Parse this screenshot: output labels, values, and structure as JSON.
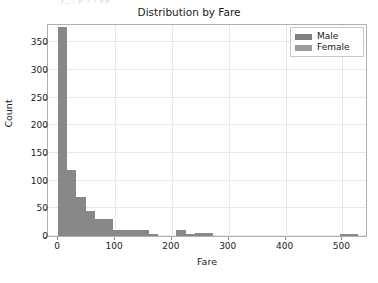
{
  "top_cutoff_text": "y_ , p ( )  pp",
  "axis": {
    "ylabel": "Count",
    "xlabel": "Fare",
    "yticks": [
      "0",
      "50",
      "100",
      "150",
      "200",
      "250",
      "300",
      "350"
    ],
    "xticks": [
      "0",
      "100",
      "200",
      "300",
      "400",
      "500"
    ]
  },
  "legend": {
    "items": [
      {
        "label": "Male",
        "color": "#7f7f7f"
      },
      {
        "label": "Female",
        "color": "#9a9a9a"
      }
    ]
  },
  "chart_data": {
    "type": "bar",
    "title": "Distribution by Fare",
    "xlabel": "Fare",
    "ylabel": "Count",
    "xlim": [
      -18,
      545
    ],
    "ylim": [
      0,
      385
    ],
    "grid": true,
    "legend_position": "upper right",
    "bin_width": 16,
    "bar_color": "#888888",
    "series": [
      {
        "name": "Male",
        "color": "#7f7f7f",
        "note": "overlapping histogram; bars render as merged gray"
      },
      {
        "name": "Female",
        "color": "#9a9a9a",
        "note": "overlapping histogram; bars render as merged gray"
      }
    ],
    "bins": [
      {
        "x0": 0,
        "x1": 16,
        "count": 377
      },
      {
        "x0": 16,
        "x1": 32,
        "count": 120
      },
      {
        "x0": 32,
        "x1": 48,
        "count": 70
      },
      {
        "x0": 48,
        "x1": 64,
        "count": 45
      },
      {
        "x0": 64,
        "x1": 80,
        "count": 30
      },
      {
        "x0": 80,
        "x1": 96,
        "count": 30
      },
      {
        "x0": 96,
        "x1": 112,
        "count": 10
      },
      {
        "x0": 112,
        "x1": 128,
        "count": 10
      },
      {
        "x0": 128,
        "x1": 144,
        "count": 10
      },
      {
        "x0": 144,
        "x1": 160,
        "count": 10
      },
      {
        "x0": 160,
        "x1": 176,
        "count": 4
      },
      {
        "x0": 176,
        "x1": 192,
        "count": 0
      },
      {
        "x0": 192,
        "x1": 208,
        "count": 0
      },
      {
        "x0": 208,
        "x1": 224,
        "count": 11
      },
      {
        "x0": 224,
        "x1": 240,
        "count": 4
      },
      {
        "x0": 240,
        "x1": 256,
        "count": 5
      },
      {
        "x0": 256,
        "x1": 272,
        "count": 5
      },
      {
        "x0": 272,
        "x1": 496,
        "count": 0
      },
      {
        "x0": 496,
        "x1": 528,
        "count": 3
      }
    ]
  }
}
